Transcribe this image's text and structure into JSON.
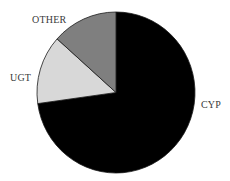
{
  "chart_data": {
    "type": "pie",
    "title": "",
    "categories": [
      "CYP",
      "UGT",
      "OTHER"
    ],
    "values": [
      72.8,
      13.8,
      13.4
    ],
    "units": "percent (estimated from slice angles)",
    "colors": [
      "#000000",
      "#d8d8d8",
      "#7f7f7f"
    ],
    "start_angle_deg": 0,
    "direction": "clockwise",
    "legend": "none (direct labels)"
  },
  "labels": {
    "cyp": "CYP",
    "ugt": "UGT",
    "other": "OTHER"
  }
}
